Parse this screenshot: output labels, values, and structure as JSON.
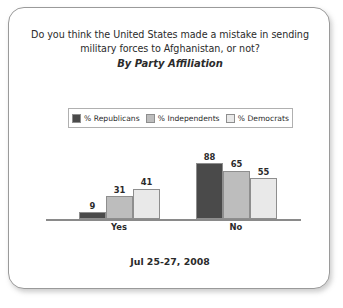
{
  "card": {
    "title_lines": [
      "Do you think the United States made a mistake in sending",
      "military forces to Afghanistan, or not?"
    ],
    "subtitle": "By Party Affiliation",
    "footer_date": "Jul 25-27, 2008"
  },
  "legend": {
    "items": [
      {
        "label": "% Republicans",
        "color": "#4a4a4a"
      },
      {
        "label": "% Independents",
        "color": "#bdbdbd"
      },
      {
        "label": "% Democrats",
        "color": "#e9e9e9"
      }
    ]
  },
  "chart_data": {
    "type": "bar",
    "title": "Do you think the United States made a mistake in sending military forces to Afghanistan, or not?",
    "subtitle": "By Party Affiliation",
    "xlabel": "",
    "ylabel": "",
    "ylim": [
      0,
      100
    ],
    "grid": false,
    "legend_position": "top-center",
    "categories": [
      "Yes",
      "No"
    ],
    "series": [
      {
        "name": "% Republicans",
        "color": "#4a4a4a",
        "values": [
          9,
          88
        ]
      },
      {
        "name": "% Independents",
        "color": "#bdbdbd",
        "values": [
          31,
          65
        ]
      },
      {
        "name": "% Democrats",
        "color": "#e9e9e9",
        "values": [
          41,
          55
        ]
      }
    ],
    "annotation": "Jul 25-27, 2008"
  }
}
